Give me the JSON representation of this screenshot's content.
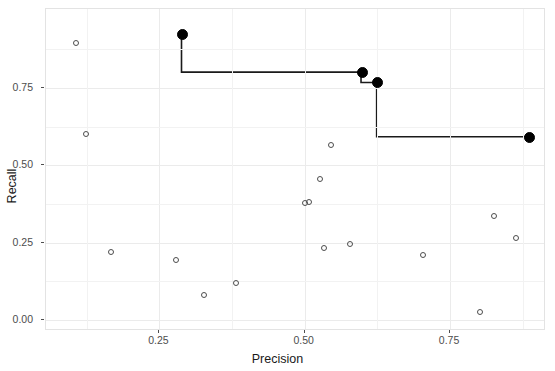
{
  "chart_data": {
    "type": "scatter",
    "title": "",
    "xlabel": "Precision",
    "ylabel": "Recall",
    "xlim": [
      0.055,
      0.915
    ],
    "ylim": [
      -0.035,
      1.005
    ],
    "xticks": [
      0.25,
      0.5,
      0.75
    ],
    "xtick_labels": [
      "0.25",
      "0.50",
      "0.75"
    ],
    "yticks": [
      0.0,
      0.25,
      0.5,
      0.75
    ],
    "ytick_labels": [
      "0.00",
      "0.25",
      "0.50",
      "0.75"
    ],
    "grid": true,
    "legend": "none",
    "series": [
      {
        "name": "pareto-frontier-points",
        "marker": "filled-circle",
        "color": "#000000",
        "points": [
          {
            "x": 0.289,
            "y": 0.922
          },
          {
            "x": 0.599,
            "y": 0.8
          },
          {
            "x": 0.626,
            "y": 0.766
          },
          {
            "x": 0.887,
            "y": 0.59
          }
        ]
      },
      {
        "name": "dominated-points",
        "marker": "open-circle",
        "color": "#4d4d4d",
        "points": [
          {
            "x": 0.107,
            "y": 0.895
          },
          {
            "x": 0.123,
            "y": 0.6
          },
          {
            "x": 0.166,
            "y": 0.22
          },
          {
            "x": 0.278,
            "y": 0.195
          },
          {
            "x": 0.326,
            "y": 0.082
          },
          {
            "x": 0.382,
            "y": 0.12
          },
          {
            "x": 0.501,
            "y": 0.377
          },
          {
            "x": 0.508,
            "y": 0.383
          },
          {
            "x": 0.527,
            "y": 0.455
          },
          {
            "x": 0.546,
            "y": 0.565
          },
          {
            "x": 0.534,
            "y": 0.232
          },
          {
            "x": 0.578,
            "y": 0.245
          },
          {
            "x": 0.703,
            "y": 0.209
          },
          {
            "x": 0.826,
            "y": 0.336
          },
          {
            "x": 0.864,
            "y": 0.264
          },
          {
            "x": 0.801,
            "y": 0.025
          }
        ]
      },
      {
        "name": "frontier-step-line",
        "marker": "none",
        "color": "#1a1a1a",
        "line_style": "step-after",
        "points": [
          {
            "x": 0.289,
            "y": 0.922
          },
          {
            "x": 0.289,
            "y": 0.8
          },
          {
            "x": 0.599,
            "y": 0.8
          },
          {
            "x": 0.599,
            "y": 0.766
          },
          {
            "x": 0.626,
            "y": 0.766
          },
          {
            "x": 0.626,
            "y": 0.59
          },
          {
            "x": 0.887,
            "y": 0.59
          }
        ]
      }
    ]
  },
  "axes": {
    "x_title": "Precision",
    "y_title": "Recall",
    "x_tick_labels": [
      "0.25",
      "0.50",
      "0.75"
    ],
    "y_tick_labels": [
      "0.00",
      "0.25",
      "0.50",
      "0.75"
    ]
  },
  "style": {
    "panel_background": "#ffffff",
    "grid_major_color": "#ebebeb",
    "grid_minor_color": "#f5f5f5",
    "panel_border_color": "#e3e3e3",
    "point_open_color": "#4d4d4d",
    "point_filled_color": "#000000",
    "line_color": "#1a1a1a",
    "tick_label_color": "#4d4d4d",
    "axis_title_color": "#1a1a1a"
  }
}
